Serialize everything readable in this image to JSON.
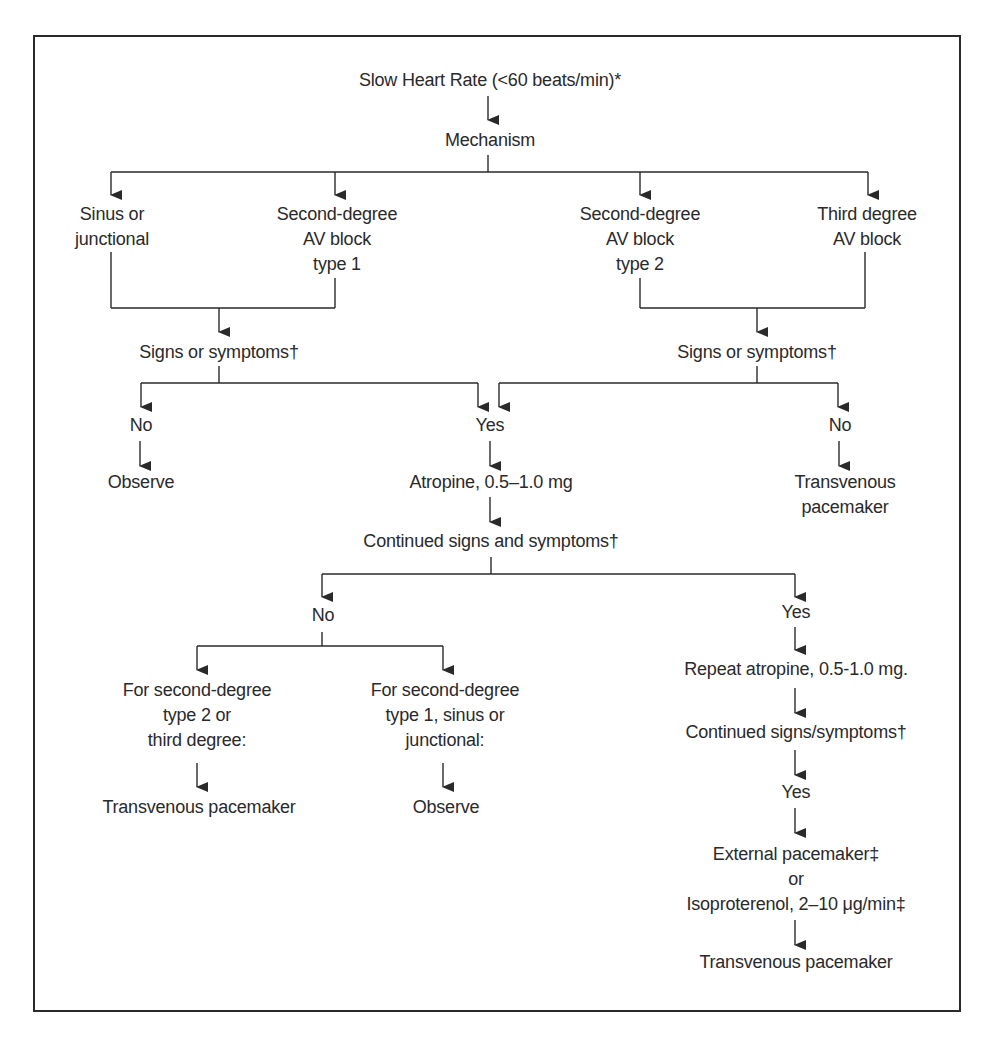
{
  "diagram": {
    "type": "flowchart",
    "title": "Slow Heart Rate (<60 beats/min)*",
    "colors": {
      "line": "#2a2a2a",
      "text": "#2a2a2a",
      "background": "#ffffff"
    },
    "nodes": {
      "root": {
        "lines": [
          "Slow Heart Rate (<60 beats/min)*"
        ]
      },
      "mechanism": {
        "lines": [
          "Mechanism"
        ]
      },
      "sinus": {
        "lines": [
          "Sinus or",
          "junctional"
        ]
      },
      "avb1": {
        "lines": [
          "Second-degree",
          "AV block",
          "type 1"
        ]
      },
      "avb2": {
        "lines": [
          "Second-degree",
          "AV block",
          "type 2"
        ]
      },
      "avb3": {
        "lines": [
          "Third degree",
          "AV block"
        ]
      },
      "signs_left": {
        "lines": [
          "Signs or symptoms†"
        ]
      },
      "signs_right": {
        "lines": [
          "Signs or symptoms†"
        ]
      },
      "no_left": {
        "lines": [
          "No"
        ]
      },
      "yes_center": {
        "lines": [
          "Yes"
        ]
      },
      "no_right": {
        "lines": [
          "No"
        ]
      },
      "observe_1": {
        "lines": [
          "Observe"
        ]
      },
      "atropine": {
        "lines": [
          "Atropine, 0.5–1.0 mg"
        ]
      },
      "tvp_1": {
        "lines": [
          "Transvenous",
          "pacemaker"
        ]
      },
      "continued": {
        "lines": [
          "Continued signs and symptoms†"
        ]
      },
      "no_continued": {
        "lines": [
          "No"
        ]
      },
      "yes_continued": {
        "lines": [
          "Yes"
        ]
      },
      "for_type2": {
        "lines": [
          "For second-degree",
          "type 2 or",
          "third degree:"
        ]
      },
      "for_type1": {
        "lines": [
          "For second-degree",
          "type 1, sinus or",
          "junctional:"
        ]
      },
      "repeat_atropine": {
        "lines": [
          "Repeat atropine, 0.5-1.0 mg."
        ]
      },
      "continued_2": {
        "lines": [
          "Continued signs/symptoms†"
        ]
      },
      "tvp_2": {
        "lines": [
          "Transvenous pacemaker"
        ]
      },
      "observe_2": {
        "lines": [
          "Observe"
        ]
      },
      "yes_final": {
        "lines": [
          "Yes"
        ]
      },
      "external": {
        "lines": [
          "External pacemaker‡",
          "or",
          "Isoproterenol, 2–10 μg/min‡"
        ]
      },
      "tvp_3": {
        "lines": [
          "Transvenous pacemaker"
        ]
      }
    },
    "edges": [
      [
        "root",
        "mechanism"
      ],
      [
        "mechanism",
        "sinus"
      ],
      [
        "mechanism",
        "avb1"
      ],
      [
        "mechanism",
        "avb2"
      ],
      [
        "mechanism",
        "avb3"
      ],
      [
        "sinus",
        "signs_left"
      ],
      [
        "avb1",
        "signs_left"
      ],
      [
        "avb2",
        "signs_right"
      ],
      [
        "avb3",
        "signs_right"
      ],
      [
        "signs_left",
        "no_left"
      ],
      [
        "signs_left",
        "yes_center"
      ],
      [
        "signs_right",
        "yes_center"
      ],
      [
        "signs_right",
        "no_right"
      ],
      [
        "no_left",
        "observe_1"
      ],
      [
        "yes_center",
        "atropine"
      ],
      [
        "no_right",
        "tvp_1"
      ],
      [
        "atropine",
        "continued"
      ],
      [
        "continued",
        "no_continued"
      ],
      [
        "continued",
        "yes_continued"
      ],
      [
        "no_continued",
        "for_type2"
      ],
      [
        "no_continued",
        "for_type1"
      ],
      [
        "for_type2",
        "tvp_2"
      ],
      [
        "for_type1",
        "observe_2"
      ],
      [
        "yes_continued",
        "repeat_atropine"
      ],
      [
        "repeat_atropine",
        "continued_2"
      ],
      [
        "continued_2",
        "yes_final"
      ],
      [
        "yes_final",
        "external"
      ],
      [
        "external",
        "tvp_3"
      ]
    ]
  }
}
